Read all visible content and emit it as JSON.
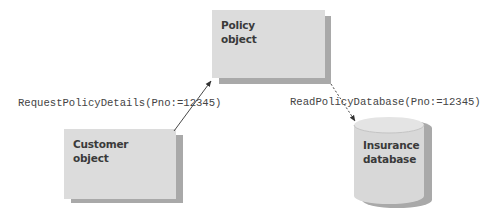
{
  "diagram": {
    "nodes": {
      "policy": {
        "line1": "Policy",
        "line2": "object"
      },
      "customer": {
        "line1": "Customer",
        "line2": "object"
      },
      "database": {
        "line1": "Insurance",
        "line2": "database"
      }
    },
    "messages": {
      "request": "RequestPolicyDetails(Pno:=12345)",
      "read": "ReadPolicyDatabase(Pno:=12345)"
    },
    "colors": {
      "box_fill": "#dcdcdc",
      "shadow": "#a9a9a9",
      "text": "#3a3a3a",
      "arrow": "#333333"
    }
  }
}
